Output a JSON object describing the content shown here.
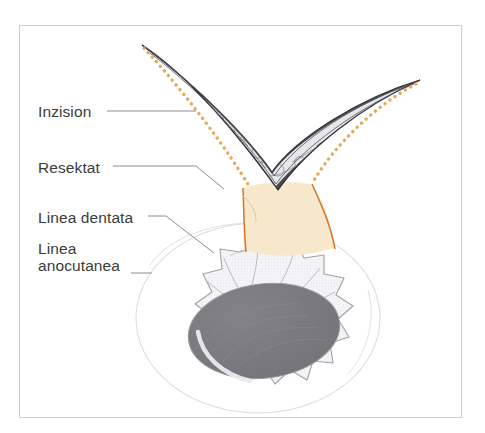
{
  "figure": {
    "frame_color": "#c3cfe2",
    "background": "#ffffff"
  },
  "labels": [
    {
      "id": "inzision",
      "text": "Inzision",
      "x": 38,
      "y": 103
    },
    {
      "id": "resektat",
      "text": "Resektat",
      "x": 38,
      "y": 159
    },
    {
      "id": "dentata",
      "text": "Linea dentata",
      "x": 38,
      "y": 209
    },
    {
      "id": "anocutanea",
      "text": "Linea\nanocutanea",
      "x": 38,
      "y": 240
    }
  ],
  "colors": {
    "text": "#3b3b3b",
    "leader_line": "#8b8b8b",
    "incision_dotted": "#e8a857",
    "resektat_fill": "#f6e5c4",
    "resektat_edge": "#d4762c",
    "tissue_dark": "#3c3c42",
    "tissue_light": "#f2f2f4",
    "sphincter_outline": "#9a9aa4",
    "anal_canal": "#7a7a7e",
    "buttock_outline": "#d8d8de"
  },
  "annotations": {
    "incision_style": "orange dotted line",
    "resektat_shape": "wedge / fan",
    "anus_shape": "radiating folds with dark oval canal"
  }
}
